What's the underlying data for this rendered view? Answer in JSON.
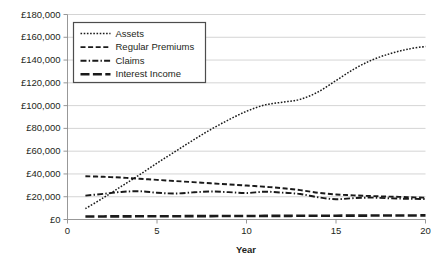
{
  "chart_data": {
    "type": "line",
    "title": "",
    "xlabel": "Year",
    "ylabel": "",
    "xlim": [
      0,
      20
    ],
    "ylim": [
      0,
      180000
    ],
    "grid": true,
    "legend_position": "top-left",
    "currency_symbol": "£",
    "x_ticks": [
      0,
      5,
      10,
      15,
      20
    ],
    "x_tick_labels": [
      "0",
      "5",
      "10",
      "15",
      "20"
    ],
    "y_ticks": [
      0,
      20000,
      40000,
      60000,
      80000,
      100000,
      120000,
      140000,
      160000,
      180000
    ],
    "y_tick_labels": [
      "£0",
      "£20,000",
      "£40,000",
      "£60,000",
      "£80,000",
      "£100,000",
      "£120,000",
      "£140,000",
      "£160,000",
      "£180,000"
    ],
    "x": [
      1,
      2,
      3,
      4,
      5,
      6,
      7,
      8,
      9,
      10,
      11,
      12,
      13,
      14,
      15,
      16,
      17,
      18,
      19,
      20
    ],
    "series": [
      {
        "name": "Assets",
        "style": "dotted",
        "dash": "1.6,1.6",
        "width": 1.5,
        "values": [
          9500,
          19000,
          29000,
          39000,
          49500,
          59500,
          69500,
          79000,
          87500,
          95000,
          100500,
          103000,
          105500,
          112000,
          122000,
          132000,
          140000,
          145500,
          149500,
          152000
        ]
      },
      {
        "name": "Regular Premiums",
        "style": "dashed",
        "dash": "5,2.6",
        "width": 1.9,
        "values": [
          38000,
          37500,
          36800,
          35800,
          34800,
          33800,
          32800,
          31800,
          30800,
          29800,
          28800,
          27500,
          25800,
          23500,
          22000,
          21200,
          20600,
          20100,
          19600,
          19200
        ]
      },
      {
        "name": "Claims",
        "style": "dash-dot",
        "dash": "6,2.2,1.4,2.2",
        "width": 1.9,
        "values": [
          21000,
          22500,
          24200,
          24800,
          23500,
          22800,
          23800,
          24600,
          24000,
          23200,
          24400,
          23600,
          22400,
          19500,
          17800,
          18800,
          19200,
          18600,
          18200,
          18000
        ]
      },
      {
        "name": "Interest Income",
        "style": "long-dash",
        "dash": "9,3.4",
        "width": 2.6,
        "values": [
          2600,
          2700,
          2750,
          2800,
          2850,
          2900,
          2950,
          3000,
          3050,
          3100,
          3150,
          3200,
          3250,
          3300,
          3350,
          3400,
          3450,
          3500,
          3550,
          3600
        ]
      }
    ],
    "legend_entries": [
      "Assets",
      "Regular Premiums",
      "Claims",
      "Interest Income"
    ]
  }
}
